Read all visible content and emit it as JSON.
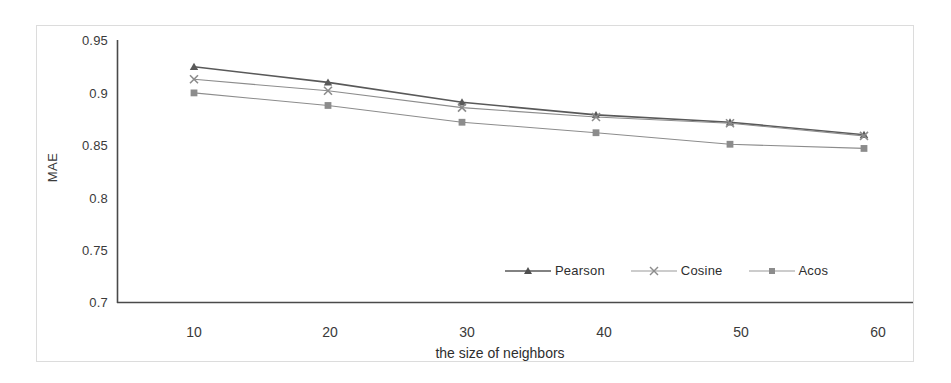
{
  "chart_data": {
    "type": "line",
    "title": "",
    "xlabel": "the size of neighbors",
    "ylabel": "MAE",
    "categories": [
      10,
      20,
      30,
      40,
      50,
      60
    ],
    "x_tick_labels": [
      "10",
      "20",
      "30",
      "40",
      "50",
      "60"
    ],
    "y_tick_labels": [
      "0.95",
      "0.9",
      "0.85",
      "0.8",
      "0.75",
      "0.7"
    ],
    "y_ticks": [
      0.95,
      0.9,
      0.85,
      0.8,
      0.75,
      0.7
    ],
    "ylim": [
      0.7,
      0.95
    ],
    "xlim": [
      10,
      60
    ],
    "grid": false,
    "legend_position": "inside-bottom-center",
    "series": [
      {
        "name": "Pearson",
        "marker": "triangle",
        "color": "#595959",
        "values": [
          0.925,
          0.91,
          0.891,
          0.879,
          0.872,
          0.86
        ]
      },
      {
        "name": "Cosine",
        "marker": "x",
        "color": "#8c8c8c",
        "values": [
          0.913,
          0.902,
          0.886,
          0.877,
          0.871,
          0.859
        ]
      },
      {
        "name": "Acos",
        "marker": "square",
        "color": "#8c8c8c",
        "values": [
          0.9,
          0.888,
          0.872,
          0.862,
          0.851,
          0.847
        ]
      }
    ]
  },
  "axis": {
    "y_title": "MAE",
    "x_title": "the size of neighbors",
    "y_labels": {
      "t0": "0.95",
      "t1": "0.9",
      "t2": "0.85",
      "t3": "0.8",
      "t4": "0.75",
      "t5": "0.7"
    },
    "x_labels": {
      "t0": "10",
      "t1": "20",
      "t2": "30",
      "t3": "40",
      "t4": "50",
      "t5": "60"
    }
  },
  "legend": {
    "items": [
      {
        "label": "Pearson",
        "marker": "triangle-marker-icon"
      },
      {
        "label": "Cosine",
        "marker": "x-marker-icon"
      },
      {
        "label": "Acos",
        "marker": "square-marker-icon"
      }
    ]
  },
  "colors": {
    "axis_line": "#4a4a4a",
    "text": "#3a3a3a",
    "series_pearson": "#595959",
    "series_cosine": "#8c8c8c",
    "series_acos": "#8c8c8c",
    "frame": "#dcdcdc",
    "background": "#ffffff"
  }
}
